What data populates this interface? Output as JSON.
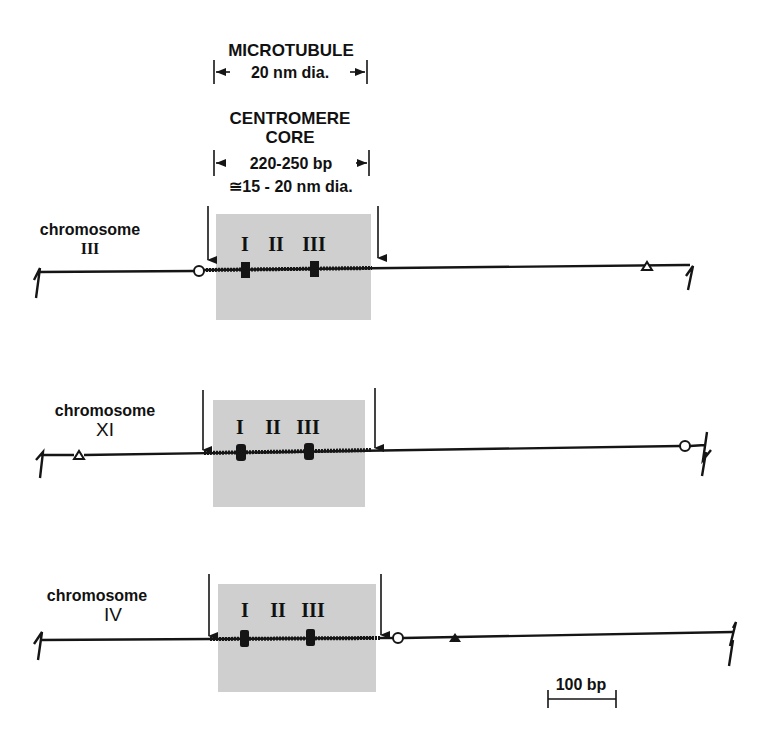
{
  "header": {
    "microtubule_title": "MICROTUBULE",
    "microtubule_dim": "20 nm dia.",
    "centromere_title_line1": "CENTROMERE",
    "centromere_title_line2": "CORE",
    "centromere_length": "220-250 bp",
    "centromere_dim": "≅15 - 20 nm dia."
  },
  "element_labels": [
    "I",
    "II",
    "III"
  ],
  "chromosomes": [
    {
      "label_line1": "chromosome",
      "label_line2": "III",
      "markers": [
        "open-circle (left of core)",
        "open-triangle (right)"
      ]
    },
    {
      "label_line1": "chromosome",
      "label_line2": "XI",
      "markers": [
        "open-triangle (left)",
        "open-circle (right)"
      ]
    },
    {
      "label_line1": "chromosome",
      "label_line2": "IV",
      "markers": [
        "open-circle (right of core)",
        "filled-triangle (right)"
      ]
    }
  ],
  "scale_bar": {
    "label": "100 bp"
  },
  "colors": {
    "ink": "#151515",
    "core_shading": "#cfcfcf",
    "background": "#ffffff"
  }
}
